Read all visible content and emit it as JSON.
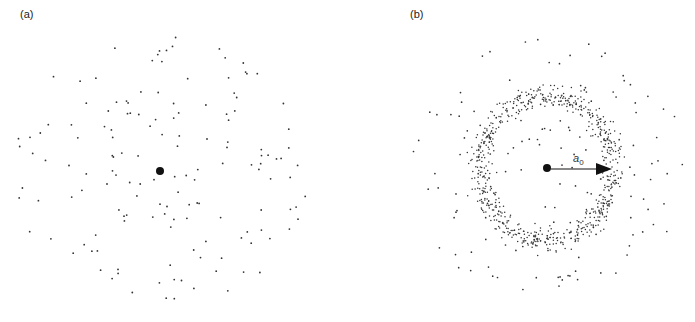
{
  "panels": [
    {
      "label": "(a)",
      "label_pos": [
        20,
        8
      ],
      "center": [
        160,
        171
      ],
      "center_radius": 4,
      "scatter": {
        "kind": "uniform-disk",
        "count": 150,
        "radius": 148,
        "seed": 17,
        "dot_radius": 0.9
      }
    },
    {
      "label": "(b)",
      "label_pos": [
        410,
        8
      ],
      "center": [
        547,
        168
      ],
      "center_radius": 4,
      "ring": {
        "kind": "annulus",
        "count": 720,
        "mean_radius": 67,
        "sigma": 5.5,
        "dot_radius": 0.75,
        "seed": 29
      },
      "scatter": {
        "kind": "uniform-disk",
        "count": 150,
        "radius": 140,
        "seed": 53,
        "dot_radius": 0.85
      },
      "arrow": {
        "from": [
          551,
          169
        ],
        "to": [
          612,
          169
        ],
        "label_main": "a",
        "label_sub": "0",
        "label_pos": [
          573,
          162
        ]
      }
    }
  ],
  "colors": {
    "dot": "#333333",
    "center": "#111111",
    "arrow": "#111111"
  }
}
